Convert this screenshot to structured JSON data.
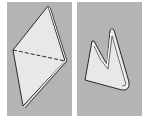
{
  "figure": {
    "panels": [
      {
        "id": "step-1",
        "depicts": "diamond-sheet-with-dashed-fold-line"
      },
      {
        "id": "step-2",
        "depicts": "folded-u-shape"
      }
    ],
    "colors": {
      "panel_bg": "#b4b4b4",
      "shape_fill": "#e6e6e6",
      "outline": "#2a2a2a",
      "page_bg": "#ffffff"
    }
  }
}
